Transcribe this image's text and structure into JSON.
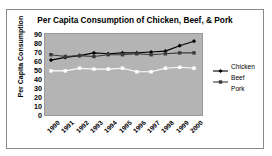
{
  "page": {
    "heading_sliver": "LINE GRAPH"
  },
  "chart_data": {
    "type": "line",
    "title": "Per Capita Consumption of Chicken, Beef, & Pork",
    "xlabel": "",
    "ylabel": "Per Capita Consumption",
    "ylim": [
      0,
      90
    ],
    "yticks": [
      90,
      80,
      70,
      60,
      50,
      40,
      30,
      20,
      10,
      0
    ],
    "grid": false,
    "legend_position": "right",
    "plot_background": "#b4b4b4",
    "categories": [
      "1990",
      "1991",
      "1992",
      "1993",
      "1994",
      "1995",
      "1996",
      "1997",
      "1998",
      "1999",
      "2000"
    ],
    "series": [
      {
        "name": "Chicken",
        "color": "#000000",
        "marker": "diamond",
        "values": [
          61,
          64,
          66,
          69,
          68,
          69,
          69,
          70,
          71,
          77,
          82
        ]
      },
      {
        "name": "Beef",
        "color": "#3a3a3a",
        "marker": "square",
        "values": [
          67,
          65,
          66,
          65,
          67,
          67,
          68,
          67,
          68,
          69,
          69
        ]
      },
      {
        "name": "Pork",
        "color": "#ffffff",
        "marker": "square",
        "values": [
          49,
          49,
          52,
          51,
          51,
          52,
          48,
          48,
          52,
          53,
          52
        ]
      }
    ]
  },
  "legend": {
    "items": [
      {
        "label": "Chicken"
      },
      {
        "label": "Beef"
      },
      {
        "label": "Pork"
      }
    ]
  }
}
